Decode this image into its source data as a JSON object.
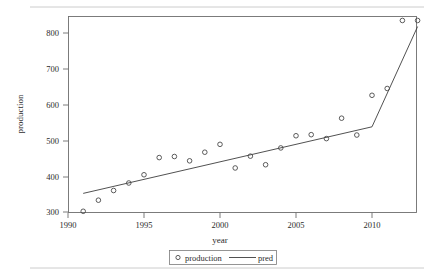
{
  "chart_data": {
    "type": "scatter",
    "title": "",
    "xlabel": "year",
    "ylabel": "production",
    "xlim": [
      1990,
      2013.5
    ],
    "ylim": [
      285,
      845
    ],
    "xticks": [
      1990,
      1995,
      2000,
      2005,
      2010
    ],
    "yticks": [
      300,
      400,
      500,
      600,
      700,
      800
    ],
    "grid": false,
    "legend_position": "bottom-center",
    "series": [
      {
        "name": "production",
        "type": "scatter",
        "marker": "open-circle",
        "x": [
          1991,
          1992,
          1993,
          1994,
          1995,
          1996,
          1997,
          1998,
          1999,
          2000,
          2001,
          2002,
          2003,
          2004,
          2005,
          2006,
          2007,
          2008,
          2009,
          2010,
          2011,
          2012,
          2013
        ],
        "y": [
          302,
          333,
          360,
          381,
          404,
          452,
          455,
          443,
          467,
          489,
          423,
          456,
          432,
          479,
          513,
          516,
          505,
          562,
          515,
          626,
          645,
          835,
          835
        ]
      },
      {
        "name": "pred",
        "type": "line",
        "x": [
          1991,
          2010,
          2013
        ],
        "y": [
          352,
          538,
          818
        ]
      }
    ],
    "legend": [
      {
        "label": "production",
        "symbol": "open-circle"
      },
      {
        "label": "pred",
        "symbol": "line"
      }
    ],
    "colors": {
      "marker": "#4a4a4a",
      "line": "#3d3d3d",
      "axis": "#6e6e6e",
      "text": "#2b2b2b",
      "background": "#ffffff"
    }
  },
  "axis": {
    "x_tick_labels": [
      "1990",
      "1995",
      "2000",
      "2005",
      "2010"
    ],
    "y_tick_labels": [
      "300",
      "400",
      "500",
      "600",
      "700",
      "800"
    ],
    "x_title": "year",
    "y_title": "production"
  },
  "legend": {
    "production_label": "production",
    "pred_label": "pred"
  }
}
